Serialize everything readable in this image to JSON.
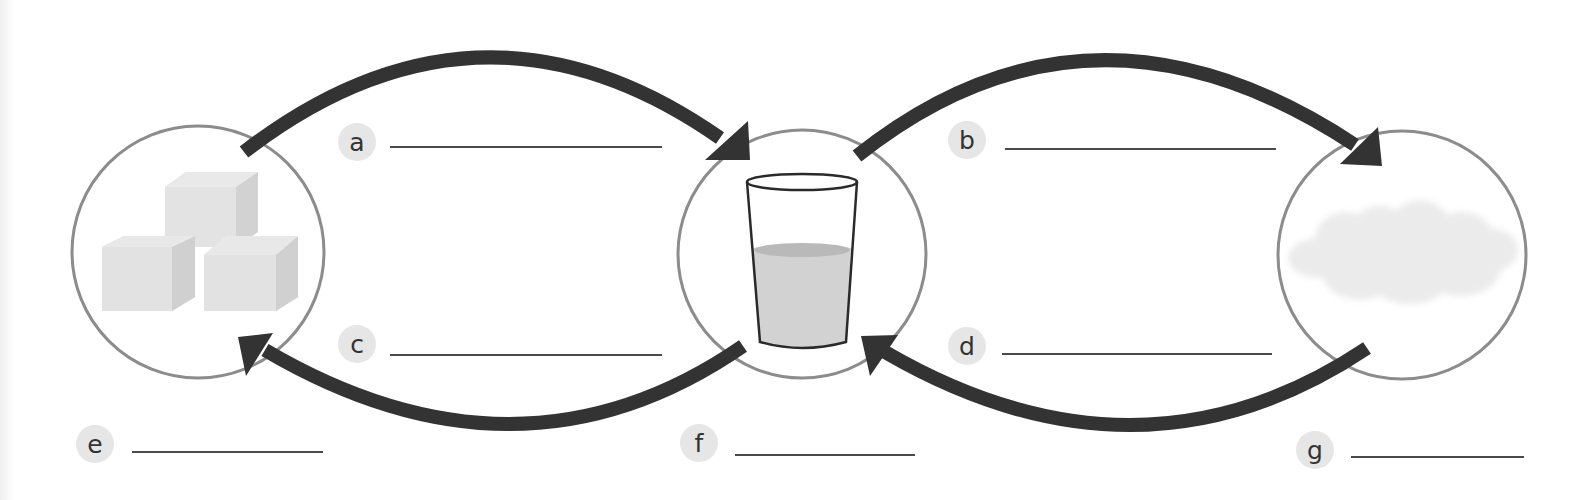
{
  "diagram": {
    "states": [
      {
        "id": "solid",
        "depiction": "ice-cubes",
        "cx": 198,
        "cy": 252,
        "r": 126
      },
      {
        "id": "liquid",
        "depiction": "glass-of-water",
        "cx": 802,
        "cy": 254,
        "r": 124
      },
      {
        "id": "gas",
        "depiction": "steam-cloud",
        "cx": 1402,
        "cy": 255,
        "r": 124
      }
    ],
    "process_labels": [
      {
        "letter": "a",
        "answer": "",
        "x": 338,
        "y": 123,
        "line_x1": 390,
        "line_x2": 662,
        "line_y": 147
      },
      {
        "letter": "b",
        "answer": "",
        "x": 948,
        "y": 121,
        "line_x1": 1005,
        "line_x2": 1276,
        "line_y": 149
      },
      {
        "letter": "c",
        "answer": "",
        "x": 338,
        "y": 325,
        "line_x1": 390,
        "line_x2": 662,
        "line_y": 355
      },
      {
        "letter": "d",
        "answer": "",
        "x": 948,
        "y": 327,
        "line_x1": 1002,
        "line_x2": 1272,
        "line_y": 354
      }
    ],
    "state_labels": [
      {
        "letter": "e",
        "answer": "",
        "x": 76,
        "y": 425,
        "line_x1": 132,
        "line_x2": 323,
        "line_y": 452
      },
      {
        "letter": "f",
        "answer": "",
        "x": 680,
        "y": 424,
        "line_x1": 735,
        "line_x2": 915,
        "line_y": 455
      },
      {
        "letter": "g",
        "answer": "",
        "x": 1296,
        "y": 431,
        "line_x1": 1351,
        "line_x2": 1524,
        "line_y": 457
      }
    ],
    "arrows": [
      {
        "from": "solid",
        "to": "liquid",
        "label": "a",
        "direction": "right",
        "position": "top"
      },
      {
        "from": "liquid",
        "to": "gas",
        "label": "b",
        "direction": "right",
        "position": "top"
      },
      {
        "from": "liquid",
        "to": "solid",
        "label": "c",
        "direction": "left",
        "position": "bottom"
      },
      {
        "from": "gas",
        "to": "liquid",
        "label": "d",
        "direction": "left",
        "position": "bottom"
      }
    ],
    "colors": {
      "arrow": "#333333",
      "circle_stroke": "#8c8c8c",
      "badge_bg": "#e6e6e6",
      "line": "#4a4a4a",
      "ice": "#d9d9d9",
      "water": "#cfcfcf",
      "steam": "#ececec"
    }
  }
}
